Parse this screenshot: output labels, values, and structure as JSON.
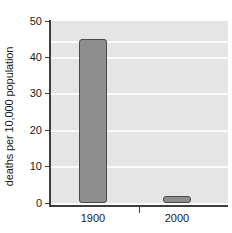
{
  "chart_data": {
    "type": "bar",
    "title": "",
    "subtitle": "",
    "xlabel": "",
    "ylabel": "deaths per 10,000 population",
    "categories": [
      "1900",
      "2000"
    ],
    "values": [
      45,
      2
    ],
    "series": [
      {
        "name": "deaths per 10,000 population",
        "values": [
          45,
          2
        ]
      }
    ],
    "ylim": [
      0,
      50
    ],
    "yticks": [
      0,
      10,
      20,
      30,
      40,
      50
    ],
    "ytick_labels": [
      "0",
      "10",
      "20",
      "30",
      "40",
      "50"
    ],
    "xtick_labels": [
      "1900",
      "2000"
    ],
    "grid": true,
    "grid_orientation": "horizontal",
    "legend": false,
    "legend_position": "none",
    "annotations": []
  },
  "style": {
    "bar_fill": "#8e8e8e",
    "bar_edge": "#4a4a4a",
    "plot_background": "#e5e5e5",
    "gridline_color": "#fbfbfb",
    "axis_color": "#3d3d3d",
    "text_color": "#1a1a1a",
    "page_background": "#ffffff"
  }
}
